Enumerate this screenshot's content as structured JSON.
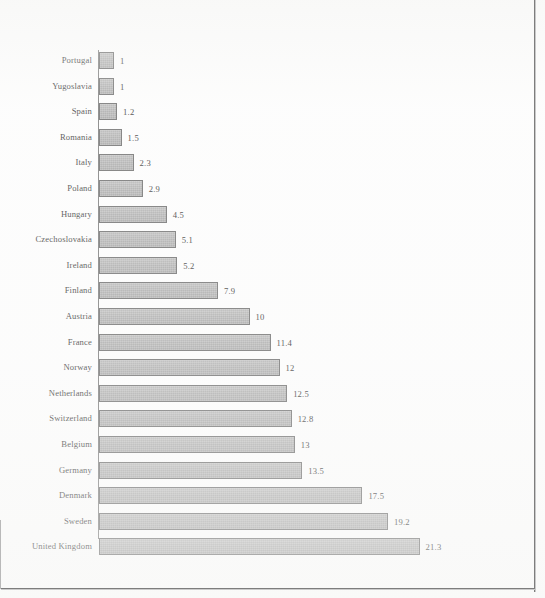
{
  "chart_data": {
    "type": "bar",
    "orientation": "horizontal",
    "title": "",
    "subtitle": "",
    "xlabel": "",
    "ylabel": "",
    "grid": false,
    "legend": null,
    "axis_origin": 0,
    "xlim": [
      0,
      21.3
    ],
    "value_labels_shown": true,
    "categories": [
      "Portugal",
      "Yugoslavia",
      "Spain",
      "Romania",
      "Italy",
      "Poland",
      "Hungary",
      "Czechoslovakia",
      "Ireland",
      "Finland",
      "Austria",
      "France",
      "Norway",
      "Netherlands",
      "Switzerland",
      "Belgium",
      "Germany",
      "Denmark",
      "Sweden",
      "United Kingdom"
    ],
    "values": [
      1,
      1,
      1.2,
      1.5,
      2.3,
      2.9,
      4.5,
      5.1,
      5.2,
      7.9,
      10,
      11.4,
      12,
      12.5,
      12.8,
      13,
      13.5,
      17.5,
      19.2,
      21.3
    ],
    "value_label_text": [
      "1",
      "1",
      "1.2",
      "1.5",
      "2.3",
      "2.9",
      "4.5",
      "5.1",
      "5.2",
      "7.9",
      "10",
      "11.4",
      "12",
      "12.5",
      "12.8",
      "13",
      "13.5",
      "17.5",
      "19.2",
      "21.3"
    ],
    "colors": {
      "bar_fill": "#a3a3a3",
      "bar_border": "#5f5f5f",
      "label_text": "#2b2b2b",
      "axis": "#6f6f6f",
      "background": "#fdfdfd",
      "frame": "#7d7d7d"
    }
  }
}
